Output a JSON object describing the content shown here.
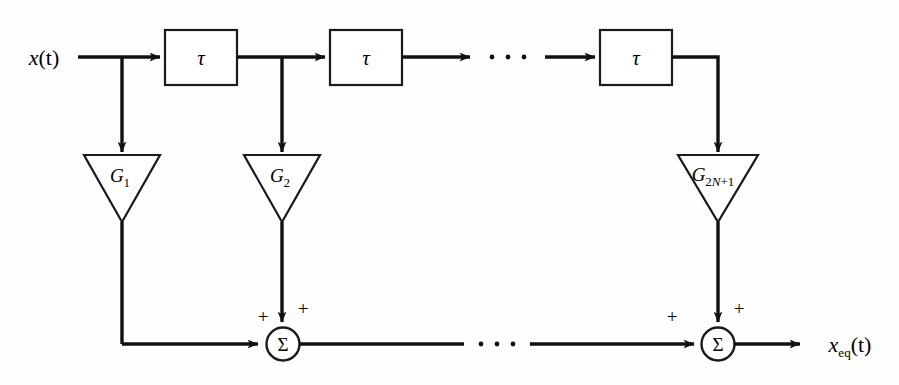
{
  "figure": {
    "type": "block-diagram",
    "background_color": "#fefefe",
    "line_color": "#111111"
  },
  "labels": {
    "input": "x(t)",
    "input_var": "x",
    "input_arg": "(t)",
    "output_var": "x",
    "output_sub": "eq",
    "output_arg": "(t)",
    "output_full": "x_eq(t)",
    "delay": "τ",
    "sigma": "Σ",
    "plus": "+",
    "ellipsis": "· · ·"
  },
  "delay_blocks": [
    {
      "id": "delay-1",
      "label": "τ"
    },
    {
      "id": "delay-2",
      "label": "τ"
    },
    {
      "id": "delay-3",
      "label": "τ"
    }
  ],
  "gain_blocks": [
    {
      "id": "gain-1",
      "symbol": "G",
      "subscript": "1",
      "full": "G1"
    },
    {
      "id": "gain-2",
      "symbol": "G",
      "subscript": "2",
      "full": "G2"
    },
    {
      "id": "gain-last",
      "symbol": "G",
      "subscript_num": "2",
      "subscript_var": "N",
      "subscript_tail": "+1",
      "full": "G2N+1"
    }
  ],
  "summers": [
    {
      "id": "summer-1",
      "label": "Σ",
      "sign_horizontal": "+",
      "sign_vertical": "+"
    },
    {
      "id": "summer-2",
      "label": "Σ",
      "sign_horizontal": "+",
      "sign_vertical": "+"
    }
  ]
}
